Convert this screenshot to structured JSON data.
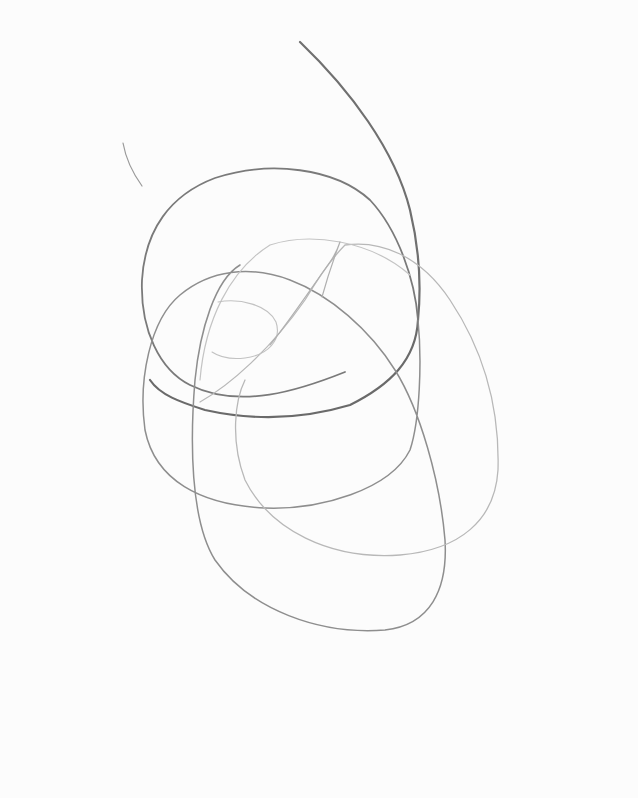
{
  "image": {
    "subject": "pencil scribble of overlapping looping curves on white paper",
    "paper_color": "#fcfcfc",
    "stroke_colors": {
      "dark": "#6a6a6a",
      "medium": "#8e8e8e",
      "light": "#b8b8b8",
      "faint": "#cfcfcf"
    }
  }
}
